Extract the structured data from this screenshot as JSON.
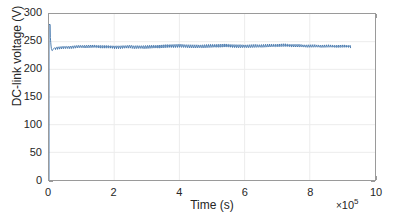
{
  "chart_data": {
    "type": "line",
    "title": "",
    "xlabel": "Time (s)",
    "ylabel": "DC-link voltage (V)",
    "x_exponent_mul": "×",
    "x_exponent_base": "10",
    "x_exponent_power": "5",
    "x_exponent_label": "×10⁵",
    "xlim": [
      0,
      10
    ],
    "ylim": [
      0,
      300
    ],
    "x_unit_scale": 100000,
    "xticks": [
      0,
      2,
      4,
      6,
      8,
      10
    ],
    "xtick_labels": [
      "0",
      "2",
      "4",
      "6",
      "8",
      "10"
    ],
    "yticks": [
      0,
      50,
      100,
      150,
      200,
      250,
      300
    ],
    "ytick_labels": [
      "0",
      "50",
      "100",
      "150",
      "200",
      "250",
      "300"
    ],
    "grid": true,
    "legend": null,
    "series": [
      {
        "name": "DC-link voltage",
        "color": "#3a6fa8",
        "line_width": 0.9,
        "data_start_x": 0.0,
        "data_end_x": 9.25,
        "startup_ramp": {
          "x": 0.0,
          "y_from": 0,
          "y_to": 281,
          "description": "vertical rise from 0 V to initial overshoot peak"
        },
        "transient": {
          "peak_value": 281,
          "peak_x": 0.035,
          "undershoot_value": 233,
          "undershoot_x": 0.09,
          "settle_x": 0.2,
          "settle_value": 238
        },
        "steady_state_mean": 241.5,
        "ripple_peak_to_peak": 5.5,
        "ripple_cycles": 150,
        "baseline_x": [
          0.2,
          0.6,
          1.0,
          1.4,
          1.8,
          2.2,
          2.5,
          2.6,
          2.9,
          3.3,
          3.7,
          4.0,
          4.2,
          4.5,
          4.8,
          5.1,
          5.4,
          5.6,
          5.8,
          6.1,
          6.4,
          6.7,
          7.0,
          7.2,
          7.5,
          7.8,
          8.1,
          8.5,
          8.9,
          9.25
        ],
        "baseline_y": [
          238.5,
          240.0,
          241.5,
          241.8,
          240.8,
          240.2,
          241.5,
          240.3,
          240.5,
          241.2,
          242.2,
          242.6,
          242.0,
          241.3,
          241.8,
          242.4,
          242.8,
          242.2,
          241.4,
          241.6,
          241.9,
          242.4,
          243.0,
          243.2,
          242.6,
          242.0,
          241.8,
          241.7,
          241.6,
          241.5
        ]
      }
    ]
  },
  "axes": {
    "box_border_color": "#9a9a9a",
    "grid_color": "#ececec",
    "tick_color": "#9a9a9a",
    "text_color": "#262626",
    "background": "#ffffff"
  }
}
